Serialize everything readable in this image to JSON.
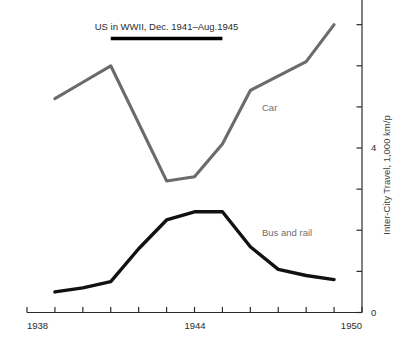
{
  "chart_data": {
    "type": "line",
    "title": "",
    "xlabel": "",
    "ylabel": "Inter-City Travel, 1,000 km/p",
    "xlim": [
      1938,
      1950
    ],
    "ylim": [
      0,
      7.6
    ],
    "grid": false,
    "legend_position": "inline-labels",
    "x_ticks": [
      1938,
      1939,
      1940,
      1941,
      1942,
      1943,
      1944,
      1945,
      1946,
      1947,
      1948,
      1949,
      1950
    ],
    "x_tick_labels": [
      "1938",
      "",
      "",
      "",
      "",
      "",
      "1944",
      "",
      "",
      "",
      "",
      "",
      "1950"
    ],
    "y_ticks": [
      0,
      1,
      2,
      3,
      4,
      5,
      6,
      7
    ],
    "y_tick_labels": [
      "0",
      "",
      "",
      "",
      "4",
      "",
      "",
      ""
    ],
    "y_axis_side": "right",
    "series": [
      {
        "name": "Car",
        "color": "#6b6b6b",
        "label": "Car",
        "x": [
          1939,
          1940,
          1941,
          1943,
          1944,
          1945,
          1946,
          1948,
          1949
        ],
        "values": [
          5.2,
          5.6,
          6.0,
          3.2,
          3.3,
          4.1,
          5.4,
          6.1,
          7.0
        ]
      },
      {
        "name": "Bus and rail",
        "color": "#111111",
        "label": "Bus and rail",
        "x": [
          1939,
          1940,
          1941,
          1942,
          1943,
          1944,
          1945,
          1946,
          1947,
          1948,
          1949
        ],
        "values": [
          0.5,
          0.6,
          0.75,
          1.55,
          2.25,
          2.45,
          2.45,
          1.6,
          1.05,
          0.9,
          0.8
        ]
      }
    ],
    "annotations": [
      {
        "name": "wwii-span",
        "text": "US in WWII, Dec. 1941–Aug.1945",
        "x_start": 1941.0,
        "x_end": 1945.0,
        "bar_color": "#000000"
      }
    ]
  },
  "labels": {
    "axis_y_title": "Inter-City Travel, 1,000 km/p",
    "x_first": "1938",
    "x_mid": "1944",
    "x_last": "1950",
    "y_zero": "0",
    "y_four": "4",
    "car": "Car",
    "bus_and_rail": "Bus and rail",
    "wwii": "US in WWII, Dec. 1941–Aug.1945"
  },
  "colors": {
    "car_line": "#6b6b6b",
    "bus_line": "#111111",
    "axis": "#2b2b2b",
    "background": "#ffffff"
  }
}
